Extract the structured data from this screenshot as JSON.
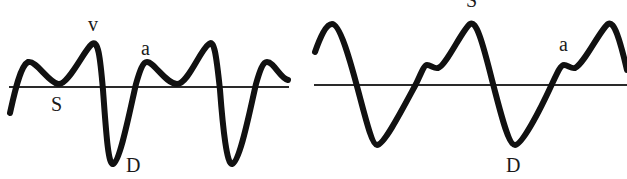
{
  "figure": {
    "colors": {
      "line": "#111111",
      "baseline": "#2a2a2a",
      "background": "#ffffff"
    }
  },
  "panels": [
    {
      "id": "left",
      "labels": {
        "v": "v",
        "a": "a",
        "s": "S",
        "d": "D"
      }
    },
    {
      "id": "right",
      "labels": {
        "s": "S",
        "a": "a",
        "d": "D"
      }
    }
  ]
}
